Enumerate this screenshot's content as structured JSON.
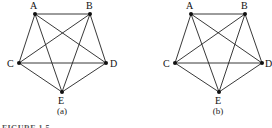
{
  "figure": {
    "caption": "FIGURE 1.5",
    "graphs": [
      {
        "id": "a",
        "sublabel": "(a)",
        "sublabel_pos": [
          62,
          114
        ],
        "nodes": [
          {
            "label": "A",
            "x": 35,
            "y": 14,
            "lx": 30,
            "ly": 9
          },
          {
            "label": "B",
            "x": 90,
            "y": 14,
            "lx": 86,
            "ly": 9
          },
          {
            "label": "C",
            "x": 19,
            "y": 63,
            "lx": 7,
            "ly": 67
          },
          {
            "label": "D",
            "x": 106,
            "y": 63,
            "lx": 110,
            "ly": 67
          },
          {
            "label": "E",
            "x": 62,
            "y": 92,
            "lx": 58,
            "ly": 104
          }
        ],
        "edges": [
          [
            "A",
            "B"
          ],
          [
            "A",
            "C"
          ],
          [
            "A",
            "D"
          ],
          [
            "A",
            "E"
          ],
          [
            "B",
            "C"
          ],
          [
            "B",
            "D"
          ],
          [
            "B",
            "E"
          ],
          [
            "C",
            "D"
          ],
          [
            "C",
            "E"
          ],
          [
            "D",
            "E"
          ]
        ]
      },
      {
        "id": "b",
        "sublabel": "(b)",
        "sublabel_pos": [
          218,
          114
        ],
        "nodes": [
          {
            "label": "A",
            "x": 191,
            "y": 14,
            "lx": 186,
            "ly": 9
          },
          {
            "label": "B",
            "x": 245,
            "y": 14,
            "lx": 241,
            "ly": 9
          },
          {
            "label": "C",
            "x": 175,
            "y": 63,
            "lx": 163,
            "ly": 67
          },
          {
            "label": "D",
            "x": 262,
            "y": 63,
            "lx": 265,
            "ly": 67
          },
          {
            "label": "E",
            "x": 219,
            "y": 92,
            "lx": 215,
            "ly": 104
          }
        ],
        "edges": [
          [
            "A",
            "B"
          ],
          [
            "A",
            "C"
          ],
          [
            "A",
            "D"
          ],
          [
            "A",
            "E"
          ],
          [
            "B",
            "C"
          ],
          [
            "B",
            "D"
          ],
          [
            "B",
            "E"
          ],
          [
            "C",
            "D"
          ],
          [
            "C",
            "E"
          ],
          [
            "D",
            "E"
          ]
        ]
      }
    ]
  }
}
